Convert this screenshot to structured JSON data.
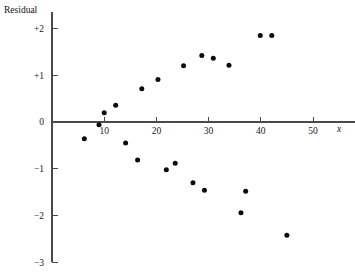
{
  "chart_data": {
    "type": "scatter",
    "title": "",
    "subtitle": "",
    "ylabel": "Residual",
    "xlabel": "x",
    "xlim": [
      0,
      58
    ],
    "ylim": [
      -3,
      2.35
    ],
    "grid": false,
    "legend": "none",
    "xticks": [
      10,
      20,
      30,
      40,
      50
    ],
    "xtick_labels": [
      "10",
      "20",
      "30",
      "40",
      "50"
    ],
    "yticks": [
      2,
      1,
      0,
      -1,
      -2,
      -3
    ],
    "ytick_labels": [
      "+2",
      "+1",
      "0",
      "-1",
      "-2",
      "-3"
    ],
    "zero_line": 0,
    "point_count": 21,
    "series": [
      {
        "name": "residuals",
        "marker": "filled-circle",
        "color": "#0b0b0b",
        "points": [
          {
            "x": 6.2,
            "y": -0.36
          },
          {
            "x": 9.0,
            "y": -0.06
          },
          {
            "x": 10.0,
            "y": 0.2
          },
          {
            "x": 12.2,
            "y": 0.36
          },
          {
            "x": 14.1,
            "y": -0.45
          },
          {
            "x": 16.4,
            "y": -0.81
          },
          {
            "x": 17.2,
            "y": 0.71
          },
          {
            "x": 20.3,
            "y": 0.91
          },
          {
            "x": 21.9,
            "y": -1.02
          },
          {
            "x": 23.6,
            "y": -0.88
          },
          {
            "x": 25.2,
            "y": 1.2
          },
          {
            "x": 27.0,
            "y": -1.3
          },
          {
            "x": 28.7,
            "y": 1.42
          },
          {
            "x": 30.9,
            "y": 1.36
          },
          {
            "x": 29.2,
            "y": -1.46
          },
          {
            "x": 33.9,
            "y": 1.21
          },
          {
            "x": 36.2,
            "y": -1.94
          },
          {
            "x": 37.1,
            "y": -1.48
          },
          {
            "x": 39.9,
            "y": 1.85
          },
          {
            "x": 42.1,
            "y": 1.85
          },
          {
            "x": 45.0,
            "y": -2.42
          }
        ]
      }
    ]
  },
  "figure": {
    "name": "residual-plot",
    "background": "#ffffff",
    "point_color": "#0b0b0b",
    "axis_color": "#4a4a4a"
  }
}
